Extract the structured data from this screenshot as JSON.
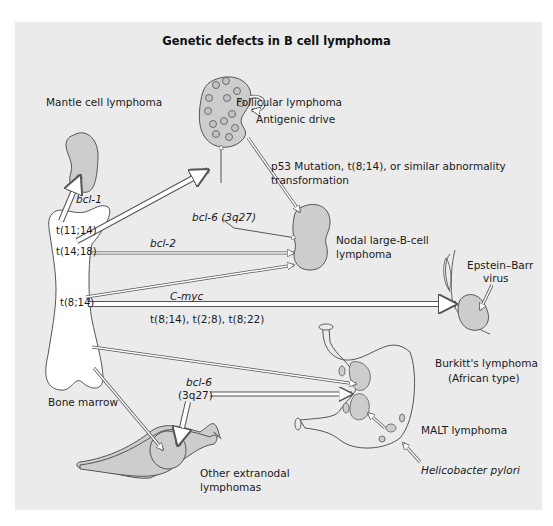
{
  "title": "Genetic defects in B cell lymphoma",
  "colors": {
    "panel_bg": "#ebebeb",
    "tissue_fill": "#cdcdcd",
    "bone_fill": "#ffffff",
    "outline": "#555555",
    "text": "#1a1a1a"
  },
  "labels": {
    "mantle_cell": "Mantle cell lymphoma",
    "follicular": "Follicular lymphoma",
    "antigenic_drive": "Antigenic drive",
    "p53_line1": "p53 Mutation, t(8;14), or similar abnormality",
    "p53_line2": "transformation",
    "bcl6_top": "bcl-6 (3q27)",
    "nodal_line1": "Nodal large-B-cell",
    "nodal_line2": "lymphoma",
    "ebv_line1": "Epstein–Barr",
    "ebv_line2": "virus",
    "bcl1": "bcl-1",
    "t11_14": "t(11;14)",
    "t14_18": "t(14;18)",
    "bcl2": "bcl-2",
    "t8_14": "t(8;14)",
    "cmyc": "C-myc",
    "translocations": "t(8;14), t(2;8), t(8;22)",
    "burkitt_line1": "Burkitt's lymphoma",
    "burkitt_line2": "(African type)",
    "bone_marrow": "Bone marrow",
    "bcl6_bottom_line1": "bcl-6",
    "bcl6_bottom_line2": "(3q27)",
    "malt": "MALT lymphoma",
    "other_line1": "Other extranodal",
    "other_line2": "lymphomas",
    "h_pylori": "Helicobacter pylori"
  }
}
